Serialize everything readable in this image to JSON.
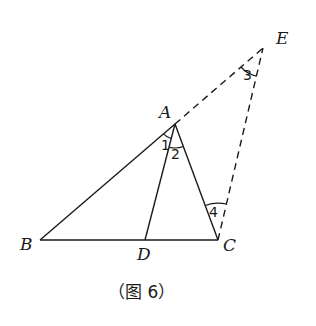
{
  "diagram": {
    "points": {
      "A": {
        "label": "A",
        "x": 175,
        "y": 124
      },
      "B": {
        "label": "B",
        "x": 40,
        "y": 240
      },
      "C": {
        "label": "C",
        "x": 218,
        "y": 240
      },
      "D": {
        "label": "D",
        "x": 145,
        "y": 240
      },
      "E": {
        "label": "E",
        "x": 263,
        "y": 48
      }
    },
    "segments": {
      "solid": [
        "AB",
        "BC",
        "AC",
        "AD"
      ],
      "dashed": [
        "AE",
        "CE"
      ]
    },
    "angles": [
      {
        "label": "1",
        "vertex": "A",
        "between": [
          "AB",
          "AD"
        ]
      },
      {
        "label": "2",
        "vertex": "A",
        "between": [
          "AD",
          "AC"
        ]
      },
      {
        "label": "3",
        "vertex": "E",
        "between": [
          "EA",
          "EC"
        ]
      },
      {
        "label": "4",
        "vertex": "C",
        "between": [
          "CA",
          "CE"
        ]
      }
    ],
    "caption": "（图 6）"
  }
}
